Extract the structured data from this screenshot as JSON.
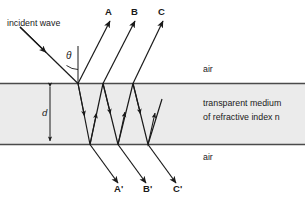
{
  "diagram": {
    "title_text": "incident wave",
    "angle_symbol": "θ",
    "thickness_symbol": "d",
    "media": {
      "top_label": "air",
      "bottom_label": "air",
      "slab_line1": "transparent medium",
      "slab_line2": "of refractive index n"
    },
    "reflected_rays": [
      {
        "label": "A"
      },
      {
        "label": "B"
      },
      {
        "label": "C"
      }
    ],
    "transmitted_rays": [
      {
        "label": "A'"
      },
      {
        "label": "B'"
      },
      {
        "label": "C'"
      }
    ],
    "colors": {
      "ink": "#1a1a1a",
      "boundary": "#4a4a4a",
      "slab_fill": "#ebebeb",
      "background": "#ffffff"
    },
    "geometry": {
      "slab_top_y": 83,
      "slab_bottom_y": 145,
      "entry_x": 78
    }
  }
}
